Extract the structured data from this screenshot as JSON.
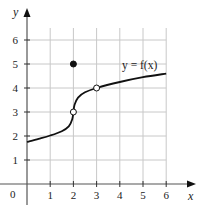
{
  "chart_data": {
    "type": "line",
    "title": "",
    "xlabel": "x",
    "ylabel": "y",
    "xlim": [
      0,
      6
    ],
    "ylim": [
      0,
      6.5
    ],
    "grid": true,
    "x_ticks": [
      "1",
      "2",
      "3",
      "4",
      "5",
      "6"
    ],
    "y_ticks": [
      "1",
      "2",
      "3",
      "4",
      "5",
      "6"
    ],
    "origin_label": "0",
    "function_label": "y = f(x)",
    "series": [
      {
        "name": "y = f(x)",
        "x": [
          0,
          0.5,
          1,
          1.5,
          1.8,
          1.95,
          2,
          2.05,
          2.2,
          2.5,
          3,
          4,
          5,
          6
        ],
        "values": [
          1.75,
          1.88,
          2.02,
          2.2,
          2.4,
          2.7,
          3,
          3.3,
          3.6,
          3.82,
          4,
          4.25,
          4.45,
          4.6
        ]
      }
    ],
    "points": [
      {
        "x": 2,
        "y": 5,
        "style": "filled"
      },
      {
        "x": 2,
        "y": 3,
        "style": "open"
      },
      {
        "x": 3,
        "y": 4,
        "style": "open"
      }
    ]
  }
}
